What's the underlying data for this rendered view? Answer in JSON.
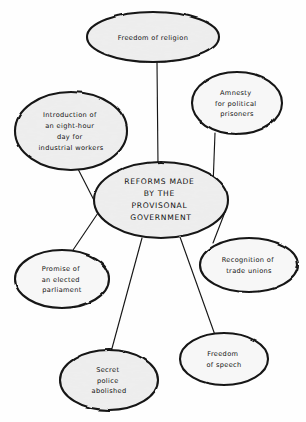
{
  "diagram": {
    "type": "mind-map",
    "center": {
      "id": "center",
      "lines": [
        "REFORMS MADE",
        "BY THE",
        "PROVISONAL",
        "GOVERNMENT"
      ],
      "text": "REFORMS MADE BY THE PROVISONAL GOVERNMENT",
      "shape": "ellipse",
      "fill": "#e9e9e9",
      "stroke": "#141414"
    },
    "branches": [
      {
        "id": "freedom-of-religion",
        "lines": [
          "Freedom of religion"
        ],
        "text": "Freedom of religion",
        "position": "top"
      },
      {
        "id": "amnesty-for-political-prisoners",
        "lines": [
          "Amnesty",
          "for political",
          "prisoners"
        ],
        "text": "Amnesty for political prisoners",
        "position": "top-right"
      },
      {
        "id": "eight-hour-day",
        "lines": [
          "Introduction of",
          "an eight-hour",
          "day for",
          "industrial workers"
        ],
        "text": "Introduction of an eight-hour day for industrial workers",
        "position": "top-left"
      },
      {
        "id": "recognition-of-trade-unions",
        "lines": [
          "Recognition of",
          "trade unions"
        ],
        "text": "Recognition of trade unions",
        "position": "right"
      },
      {
        "id": "promise-of-elected-parliament",
        "lines": [
          "Promise of",
          "an elected",
          "parliament"
        ],
        "text": "Promise of an elected parliament",
        "position": "left"
      },
      {
        "id": "freedom-of-speech",
        "lines": [
          "Freedom",
          "of speech"
        ],
        "text": "Freedom of speech",
        "position": "bottom-right"
      },
      {
        "id": "secret-police-abolished",
        "lines": [
          "Secret",
          "police",
          "abolished"
        ],
        "text": "Secret police abolished",
        "position": "bottom-left"
      }
    ],
    "connectors": [
      {
        "from": "center",
        "to": "freedom-of-religion"
      },
      {
        "from": "center",
        "to": "amnesty-for-political-prisoners"
      },
      {
        "from": "center",
        "to": "eight-hour-day"
      },
      {
        "from": "center",
        "to": "recognition-of-trade-unions"
      },
      {
        "from": "center",
        "to": "promise-of-elected-parliament"
      },
      {
        "from": "center",
        "to": "freedom-of-speech"
      },
      {
        "from": "center",
        "to": "secret-police-abolished"
      }
    ]
  }
}
